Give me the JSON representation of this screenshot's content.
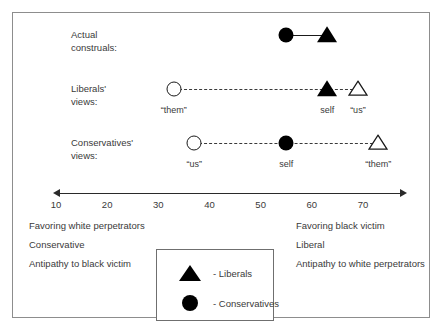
{
  "figure": {
    "frame_color": "#8d8d8d",
    "rows": [
      {
        "key": "actual",
        "label_line1": "Actual",
        "label_line2": "construals:",
        "connector": "solid"
      },
      {
        "key": "liberals",
        "label_line1": "Liberals'",
        "label_line2": "views:",
        "connector": "dashed"
      },
      {
        "key": "conservatives",
        "label_line1": "Conservatives'",
        "label_line2": "views:",
        "connector": "dashed"
      }
    ]
  },
  "chart_data": {
    "type": "scatter",
    "title": "",
    "xlabel": "",
    "ylabel": "",
    "xlim": [
      5,
      75
    ],
    "grid": false,
    "legend_position": "bottom-center",
    "axis": {
      "ticks": [
        10,
        20,
        30,
        40,
        50,
        60,
        70
      ],
      "tick_labels": [
        "10",
        "20",
        "30",
        "40",
        "50",
        "60",
        "70"
      ],
      "double_headed": true
    },
    "legend": [
      {
        "marker": "triangle-filled",
        "label": "- Liberals"
      },
      {
        "marker": "circle-filled",
        "label": "- Conservatives"
      }
    ],
    "pole_descriptors": {
      "left": [
        "Favoring white perpetrators",
        "Conservative",
        "Antipathy to black victim"
      ],
      "right": [
        "Favoring black victim",
        "Liberal",
        "Antipathy to white perpetrators"
      ]
    },
    "series": [
      {
        "name": "Actual construals",
        "row": "actual",
        "connector": "solid",
        "points": [
          {
            "x": 55,
            "marker": "circle-filled",
            "caption": ""
          },
          {
            "x": 63,
            "marker": "triangle-filled",
            "caption": ""
          }
        ]
      },
      {
        "name": "Liberals' views",
        "row": "liberals",
        "connector": "dashed",
        "points": [
          {
            "x": 33,
            "marker": "circle-open",
            "caption": "“them”"
          },
          {
            "x": 63,
            "marker": "triangle-filled",
            "caption": "self"
          },
          {
            "x": 69,
            "marker": "triangle-open",
            "caption": "“us”"
          }
        ]
      },
      {
        "name": "Conservatives' views",
        "row": "conservatives",
        "connector": "dashed",
        "points": [
          {
            "x": 37,
            "marker": "circle-open",
            "caption": "“us”"
          },
          {
            "x": 55,
            "marker": "circle-filled",
            "caption": "self"
          },
          {
            "x": 73,
            "marker": "triangle-open",
            "caption": "“them”"
          }
        ]
      }
    ]
  }
}
